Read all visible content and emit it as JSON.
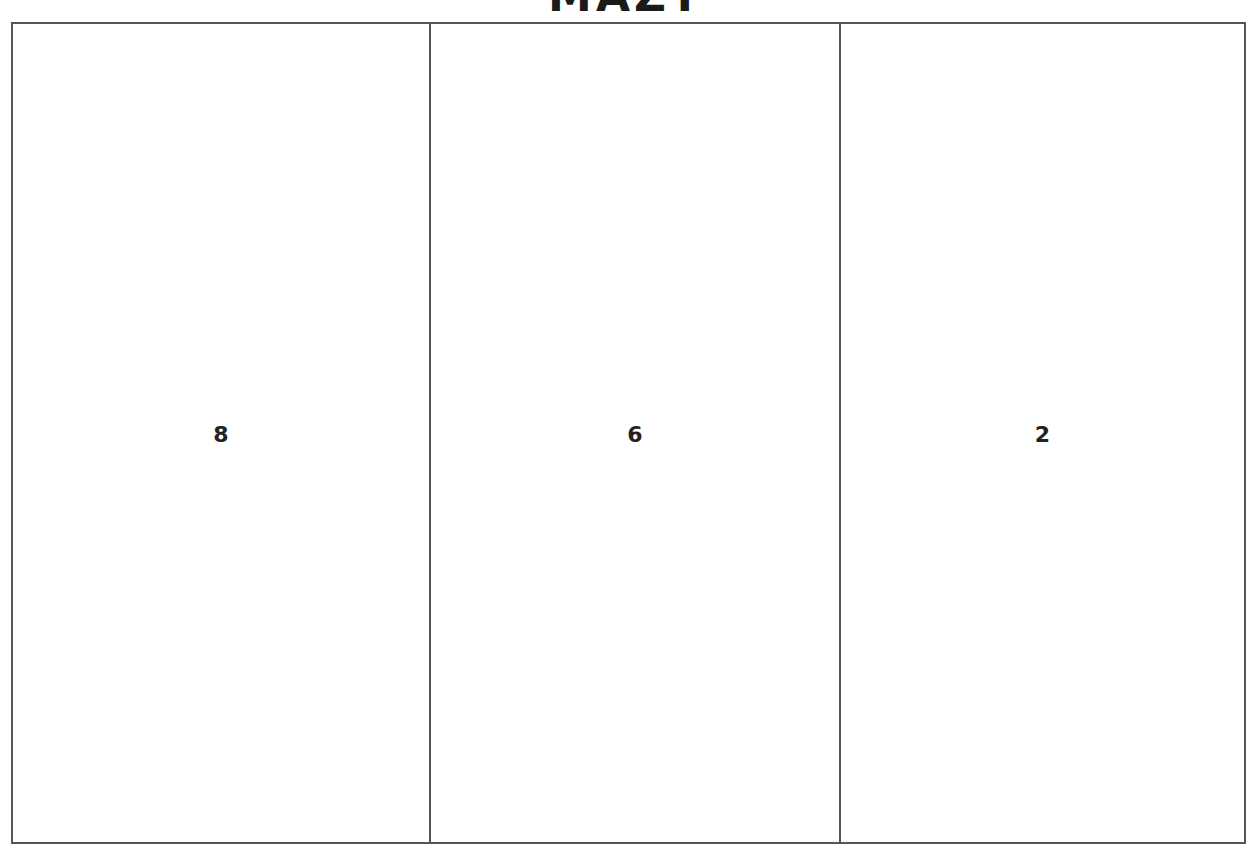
{
  "title": "MAZT",
  "cells": [
    {
      "label": "8",
      "width": 416
    },
    {
      "label": "6",
      "width": 410
    },
    {
      "label": "2",
      "width": 405
    }
  ],
  "colors": {
    "border": "#555555",
    "text": "#222222",
    "background": "#ffffff"
  }
}
